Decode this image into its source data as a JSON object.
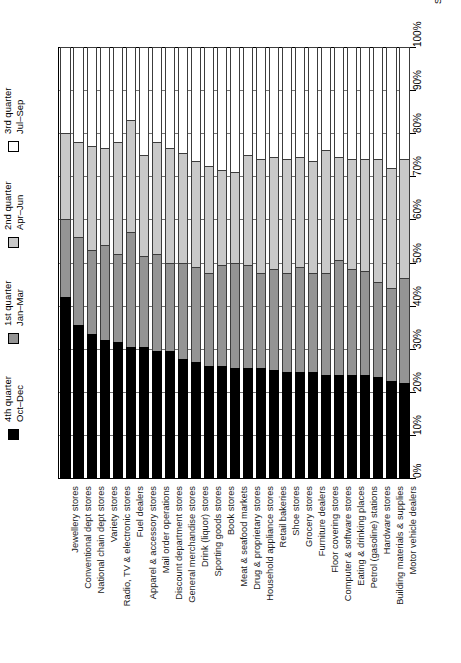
{
  "source_note": "Source: Bizstats.com",
  "legend": {
    "entries": [
      {
        "name": "q4",
        "line1": "4th quarter",
        "line2": "Oct–Dec",
        "color": "#000000"
      },
      {
        "name": "q1",
        "line1": "1st quarter",
        "line2": "Jan–Mar",
        "color": "#949494"
      },
      {
        "name": "q2",
        "line1": "2nd quarter",
        "line2": "Apr–Jun",
        "color": "#c9c9c9"
      },
      {
        "name": "q3",
        "line1": "3rd quarter",
        "line2": "Jul–Sep",
        "color": "#ffffff"
      }
    ]
  },
  "chart_data": {
    "type": "bar",
    "stacked": true,
    "orientation": "vertical",
    "title": "",
    "subtitle": "",
    "xlabel": "",
    "ylabel": "",
    "ylim": [
      0,
      100
    ],
    "yticks": [
      0,
      10,
      20,
      30,
      40,
      50,
      60,
      70,
      80,
      90,
      100
    ],
    "ytick_labels": [
      "0%",
      "10%",
      "20%",
      "30%",
      "40%",
      "50%",
      "60%",
      "70%",
      "80%",
      "90%",
      "100%"
    ],
    "grid": true,
    "legend_position": "left-outside",
    "categories": [
      "Jewellery stores",
      "Conventional dept stores",
      "National chain dept stores",
      "Variety stores",
      "Radio, TV & electronic stores",
      "Fuel dealers",
      "Apparel & accessory stores",
      "Mail order operations",
      "Discount department stores",
      "General merchandise stores",
      "Drink (liquor) stores",
      "Sporting goods stores",
      "Book stores",
      "Meat & seafood markets",
      "Drug & proprietary stores",
      "Household appliance stores",
      "Retail bakeries",
      "Shoe stores",
      "Grocery stores",
      "Furniture dealers",
      "Floor covering stores",
      "Computer & software stores",
      "Eating & drinking places",
      "Petrol (gasoline) stations",
      "Hardware stores",
      "Building materials & supplies",
      "Motor vehicle dealers"
    ],
    "series": [
      {
        "name": "4th quarter Oct–Dec",
        "key": "q4",
        "color": "#000000",
        "values": [
          42.0,
          35.5,
          33.5,
          32.0,
          31.5,
          30.5,
          30.5,
          29.5,
          29.5,
          27.5,
          27.0,
          26.0,
          26.0,
          25.5,
          25.5,
          25.5,
          25.0,
          24.5,
          24.5,
          24.5,
          24.0,
          24.0,
          24.0,
          24.0,
          23.5,
          22.5,
          22.0
        ]
      },
      {
        "name": "1st quarter Jan–Mar",
        "key": "q1",
        "color": "#949494",
        "values": [
          18.0,
          20.5,
          19.5,
          22.0,
          20.5,
          26.5,
          21.0,
          22.5,
          20.5,
          22.5,
          22.0,
          21.5,
          23.5,
          24.5,
          24.0,
          22.0,
          23.5,
          23.0,
          24.5,
          23.0,
          23.5,
          26.5,
          24.5,
          24.0,
          22.0,
          21.5,
          24.5
        ]
      },
      {
        "name": "2nd quarter Apr–Jun",
        "key": "q2",
        "color": "#c9c9c9",
        "values": [
          20.0,
          22.0,
          24.0,
          22.5,
          26.0,
          26.0,
          23.5,
          26.0,
          26.5,
          25.5,
          24.5,
          25.0,
          22.0,
          21.0,
          25.5,
          26.5,
          26.0,
          26.5,
          25.5,
          26.0,
          28.5,
          24.0,
          25.5,
          26.0,
          28.5,
          28.0,
          27.5
        ]
      },
      {
        "name": "3rd quarter Jul–Sep",
        "key": "q3",
        "color": "#ffffff",
        "values": [
          20.0,
          22.0,
          23.0,
          23.5,
          22.0,
          17.0,
          25.0,
          22.0,
          23.5,
          24.5,
          26.5,
          27.5,
          28.5,
          29.0,
          25.0,
          26.0,
          25.5,
          26.0,
          25.5,
          26.5,
          24.0,
          25.5,
          26.0,
          26.0,
          26.0,
          28.0,
          26.0
        ]
      }
    ]
  }
}
